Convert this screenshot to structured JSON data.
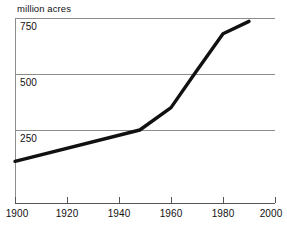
{
  "chart_data": {
    "type": "line",
    "title": "",
    "subtitle": "",
    "xlabel": "",
    "ylabel": "million acres",
    "axis_caption": "million acres",
    "xlim": [
      1900,
      2000
    ],
    "ylim": [
      0,
      790
    ],
    "grid": true,
    "legend": false,
    "legend_position": "none",
    "y_ticks": [
      250,
      500,
      750
    ],
    "y_tick_labels": [
      "250",
      "500",
      "750"
    ],
    "x_ticks": [
      1900,
      1920,
      1940,
      1960,
      1980,
      2000
    ],
    "x_tick_labels": [
      "1900",
      "1920",
      "1940",
      "1960",
      "1980",
      "2000"
    ],
    "series": [
      {
        "name": "million acres",
        "color": "#111111",
        "x": [
          1900,
          1948,
          1960,
          1969,
          1980,
          1990
        ],
        "values": [
          110,
          250,
          350,
          500,
          680,
          735
        ]
      }
    ],
    "annotations": []
  },
  "colors": {
    "line": "#111111",
    "grid": "#8c8c8c",
    "axis": "#555555",
    "text": "#111111",
    "background": "#ffffff"
  }
}
